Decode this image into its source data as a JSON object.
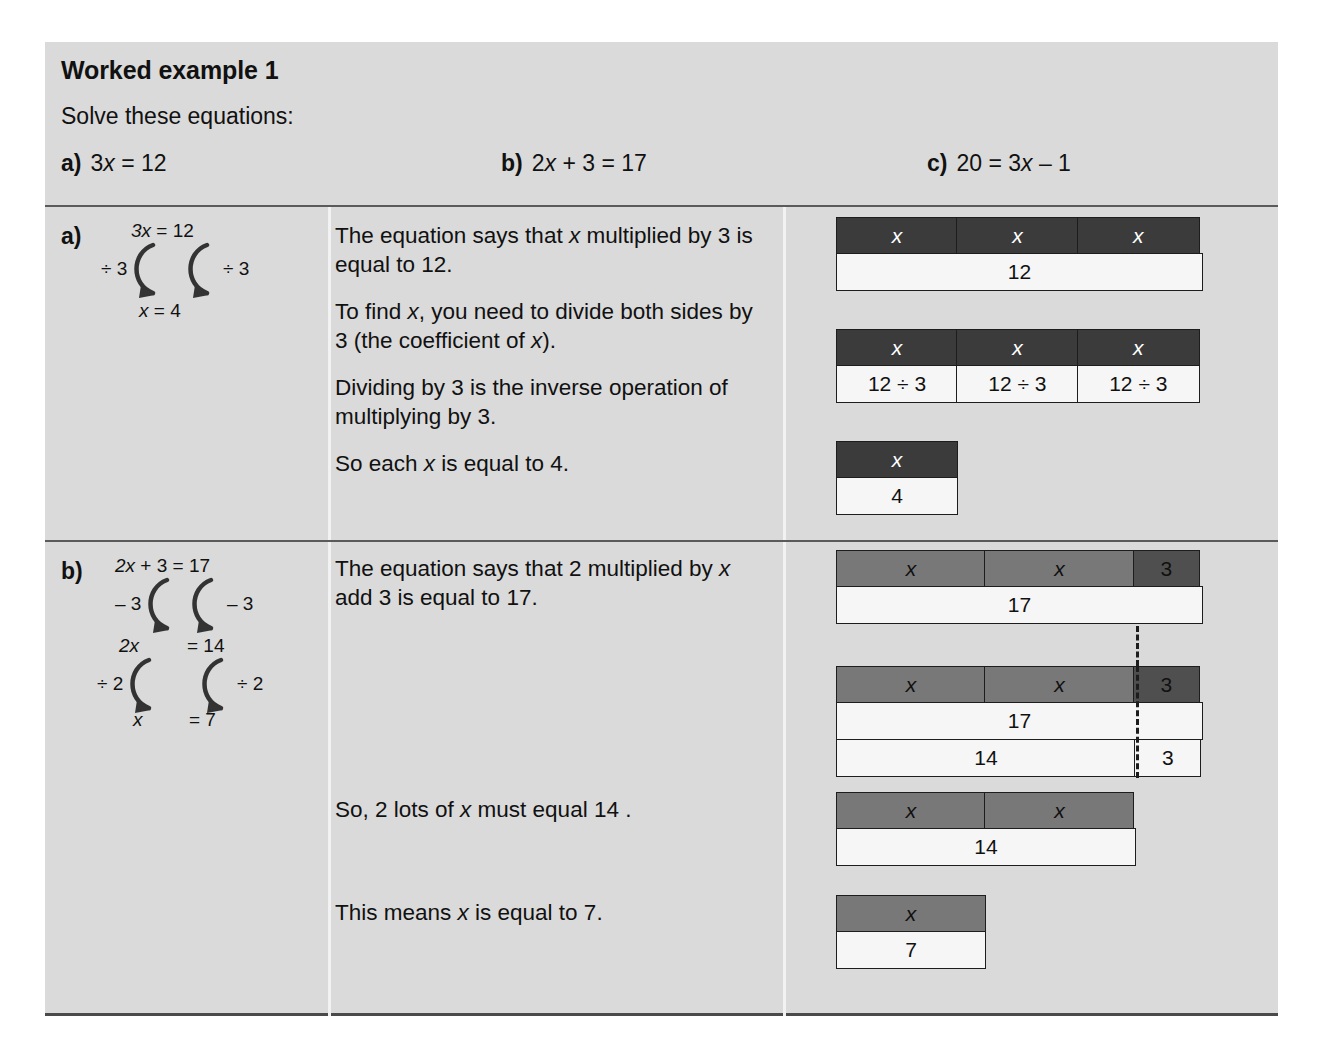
{
  "header": {
    "title": "Worked example 1",
    "instruction": "Solve these equations:",
    "equations": [
      {
        "label": "a)",
        "text": "3x = 12"
      },
      {
        "label": "b)",
        "text": "2x + 3 = 17"
      },
      {
        "label": "c)",
        "text": "20 = 3x – 1"
      }
    ]
  },
  "rows": [
    {
      "letter": "a)",
      "working": {
        "line1": "3x = 12",
        "op_left": "÷ 3",
        "op_right": "÷ 3",
        "line2": "x =  4"
      },
      "paragraphs": [
        "The equation says that x multiplied by 3 is equal to 12.",
        "To find x, you need to divide both sides by 3 (the coefficient of x).",
        "Dividing by 3 is the inverse operation of multiplying by 3.",
        "So each x is equal to 4."
      ],
      "bars": [
        {
          "name": "bar-model-a-1",
          "rows": [
            {
              "cells": [
                {
                  "text": "x",
                  "style": "dark",
                  "w": 122
                },
                {
                  "text": "x",
                  "style": "dark",
                  "w": 122
                },
                {
                  "text": "x",
                  "style": "dark",
                  "w": 123
                }
              ]
            },
            {
              "cells": [
                {
                  "text": "12",
                  "style": "light",
                  "w": 367
                }
              ]
            }
          ]
        },
        {
          "name": "bar-model-a-2",
          "rows": [
            {
              "cells": [
                {
                  "text": "x",
                  "style": "dark",
                  "w": 122
                },
                {
                  "text": "x",
                  "style": "dark",
                  "w": 122
                },
                {
                  "text": "x",
                  "style": "dark",
                  "w": 123
                }
              ]
            },
            {
              "cells": [
                {
                  "text": "12 ÷ 3",
                  "style": "light",
                  "w": 122
                },
                {
                  "text": "12 ÷ 3",
                  "style": "light",
                  "w": 122
                },
                {
                  "text": "12 ÷ 3",
                  "style": "light",
                  "w": 123
                }
              ]
            }
          ]
        },
        {
          "name": "bar-model-a-3",
          "rows": [
            {
              "cells": [
                {
                  "text": "x",
                  "style": "dark",
                  "w": 122
                }
              ]
            },
            {
              "cells": [
                {
                  "text": "4",
                  "style": "light",
                  "w": 122
                }
              ]
            }
          ]
        }
      ]
    },
    {
      "letter": "b)",
      "working": {
        "line1": "2x + 3 = 17",
        "op1_left": "– 3",
        "op1_right": "– 3",
        "line2_left": "2x",
        "line2_right": "= 14",
        "op2_left": "÷ 2",
        "op2_right": "÷ 2",
        "line3_left": "x",
        "line3_right": "=  7"
      },
      "paragraphs": [
        "The equation says that 2 multiplied by x add 3 is equal to 17.",
        "So, 2 lots of x must equal 14 .",
        "This means x is equal to 7."
      ],
      "bars": [
        {
          "name": "bar-model-b-1",
          "rows": [
            {
              "cells": [
                {
                  "text": "x",
                  "style": "mid",
                  "w": 150
                },
                {
                  "text": "x",
                  "style": "mid",
                  "w": 150
                },
                {
                  "text": "3",
                  "style": "mid-dark",
                  "w": 67
                }
              ]
            },
            {
              "cells": [
                {
                  "text": "17",
                  "style": "light",
                  "w": 367
                }
              ]
            }
          ]
        },
        {
          "name": "bar-model-b-2",
          "rows": [
            {
              "cells": [
                {
                  "text": "x",
                  "style": "mid",
                  "w": 150
                },
                {
                  "text": "x",
                  "style": "mid",
                  "w": 150
                },
                {
                  "text": "3",
                  "style": "mid-dark",
                  "w": 67
                }
              ]
            },
            {
              "cells": [
                {
                  "text": "17",
                  "style": "light",
                  "w": 367
                }
              ]
            },
            {
              "cells": [
                {
                  "text": "14",
                  "style": "light",
                  "w": 300
                },
                {
                  "text": "3",
                  "style": "light",
                  "w": 67
                }
              ]
            }
          ]
        },
        {
          "name": "bar-model-b-3",
          "rows": [
            {
              "cells": [
                {
                  "text": "x",
                  "style": "mid",
                  "w": 150
                },
                {
                  "text": "x",
                  "style": "mid",
                  "w": 150
                }
              ]
            },
            {
              "cells": [
                {
                  "text": "14",
                  "style": "light",
                  "w": 300
                }
              ]
            }
          ]
        },
        {
          "name": "bar-model-b-4",
          "rows": [
            {
              "cells": [
                {
                  "text": "x",
                  "style": "mid",
                  "w": 150
                }
              ]
            },
            {
              "cells": [
                {
                  "text": "7",
                  "style": "light",
                  "w": 150
                }
              ]
            }
          ]
        }
      ]
    }
  ],
  "colors": {
    "panel_bg": "#dadada",
    "bar_dark": "#3b3b3b",
    "bar_mid": "#787878",
    "bar_mid_dark": "#4f4f4f",
    "bar_light": "#f6f6f6",
    "rule": "#5a5a5a"
  }
}
